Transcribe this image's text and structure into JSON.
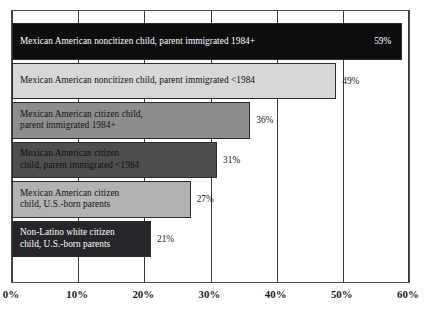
{
  "chart_data": {
    "type": "bar",
    "orientation": "horizontal",
    "title": "",
    "subtitle": "",
    "xlabel": "",
    "ylabel": "",
    "xlim": [
      0,
      60
    ],
    "xticks": [
      0,
      10,
      20,
      30,
      40,
      50,
      60
    ],
    "xtick_labels": [
      "0%",
      "10%",
      "20%",
      "30%",
      "40%",
      "50%",
      "60%"
    ],
    "grid": true,
    "grid_axis": "x",
    "legend": false,
    "legend_position": "none",
    "value_label_suffix": "%",
    "categories": [
      "Mexican American noncitizen child, parent immigrated 1984+",
      "Mexican American noncitizen child, parent immigrated <1984",
      "Mexican American citizen child,\nparent immigrated 1984+",
      "Mexican American citizen\nchild, parent immigrated <1984",
      "Mexican American citizen\nchild, U.S.-born parents",
      "Non-Latino white citizen\nchild, U.S.-born parents"
    ],
    "values": [
      59,
      49,
      36,
      31,
      27,
      21
    ],
    "value_labels": [
      "59%",
      "49%",
      "36%",
      "31%",
      "27%",
      "21%"
    ],
    "bars": [
      {
        "label": "Mexican American noncitizen child, parent immigrated 1984+",
        "value": 59,
        "value_label": "59%",
        "fill": "#0d0d0f",
        "text_color": "#ffffff",
        "value_inside": true,
        "value_color": "#ffffff"
      },
      {
        "label": "Mexican American noncitizen child, parent immigrated <1984",
        "value": 49,
        "value_label": "49%",
        "fill": "#d7d7d7",
        "text_color": "#111111",
        "value_inside": false,
        "value_color": "#1a1a1a"
      },
      {
        "label": "Mexican American citizen child,\nparent immigrated 1984+",
        "value": 36,
        "value_label": "36%",
        "fill": "#8d8d8d",
        "text_color": "#141414",
        "value_inside": false,
        "value_color": "#1a1a1a"
      },
      {
        "label": "Mexican American citizen\nchild, parent immigrated <1984",
        "value": 31,
        "value_label": "31%",
        "fill": "#4e4e4e",
        "text_color": "#111111",
        "value_inside": false,
        "value_color": "#1a1a1a"
      },
      {
        "label": "Mexican American citizen\nchild, U.S.-born parents",
        "value": 27,
        "value_label": "27%",
        "fill": "#b2b2b2",
        "text_color": "#121212",
        "value_inside": false,
        "value_color": "#1a1a1a"
      },
      {
        "label": "Non-Latino white citizen\nchild, U.S.-born parents",
        "value": 21,
        "value_label": "21%",
        "fill": "#26262a",
        "text_color": "#ffffff",
        "value_inside": false,
        "value_color": "#1a1a1a"
      }
    ]
  },
  "colors": {
    "frame": "#4a4a52",
    "gridline": "#3b3b42",
    "background": "#ffffff",
    "axis_text": "#1a1a1a"
  }
}
